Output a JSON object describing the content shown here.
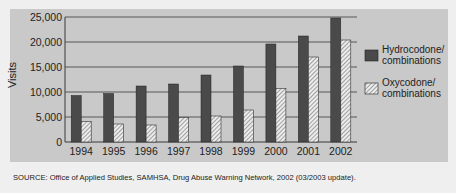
{
  "chart_data": {
    "type": "bar",
    "title": "",
    "xlabel": "",
    "ylabel": "Visits",
    "ylim": [
      0,
      25000
    ],
    "yticks": [
      0,
      5000,
      10000,
      15000,
      20000,
      25000
    ],
    "ytick_labels": [
      "0",
      "5,000",
      "10,000",
      "15,000",
      "20,000",
      "25,000"
    ],
    "grid": true,
    "legend_position": "right",
    "categories": [
      "1994",
      "1995",
      "1996",
      "1997",
      "1998",
      "1999",
      "2000",
      "2001",
      "2002"
    ],
    "series": [
      {
        "name": "Hydrocodone/ combinations",
        "style": "solid-dark",
        "color": "#4a4a4a",
        "values": [
          9300,
          9700,
          11200,
          11600,
          13400,
          15200,
          19600,
          21200,
          24800
        ]
      },
      {
        "name": "Oxycodone/ combinations",
        "style": "hatched",
        "color": "#e6e6e6",
        "values": [
          4100,
          3600,
          3400,
          4900,
          5200,
          6400,
          10700,
          17000,
          20400
        ]
      }
    ]
  },
  "legend": {
    "items": [
      {
        "line1": "Hydrocodone/",
        "line2": "combinations"
      },
      {
        "line1": "Oxycodone/",
        "line2": "combinations"
      }
    ]
  },
  "axis": {
    "ylabel": "Visits"
  },
  "source": "SOURCE: Office of Applied Studies, SAMHSA, Drug Abuse Warning Network, 2002 (03/2003 update)."
}
